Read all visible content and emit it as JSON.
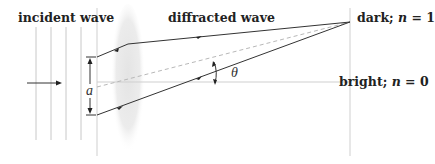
{
  "labels": {
    "incident": "incident wave",
    "diffracted": "diffracted wave",
    "dark_prefix": "dark; ",
    "dark_var": "n",
    "dark_suffix": " = 1",
    "bright_prefix": "bright; ",
    "bright_var": "n",
    "bright_suffix": " = 0",
    "slit_width": "a",
    "angle": "θ"
  },
  "colors": {
    "ray": "#333333",
    "guide": "#cfcfcf",
    "dashed": "#b8b8b8",
    "lens": "#d9d9d9"
  }
}
